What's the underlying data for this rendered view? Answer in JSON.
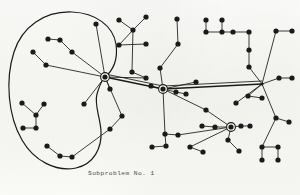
{
  "figure": {
    "caption": "Subproblem No. 1",
    "background_color": "#fbfbf8",
    "ink_color": "#1a1a1a",
    "type": "network-graph-diagram"
  },
  "graph": {
    "node_radius": 2.6,
    "hub_outer_radius": 4.4,
    "edge_width": 0.85,
    "trunk_width": 1.3,
    "boundary_width": 1.2,
    "hubs": [
      {
        "id": "hub-left",
        "label": "left-hub",
        "x": 105,
        "y": 77,
        "ringed": true
      },
      {
        "id": "hub-center",
        "label": "center-hub",
        "x": 163,
        "y": 89,
        "ringed": true
      },
      {
        "id": "hub-right",
        "label": "right-hub",
        "x": 262,
        "y": 84,
        "ringed": false
      },
      {
        "id": "hub-bottom",
        "label": "bottom-hub",
        "x": 231,
        "y": 127,
        "ringed": true
      }
    ],
    "nodes": [
      {
        "id": "n1",
        "x": 96,
        "y": 24
      },
      {
        "id": "n2",
        "x": 48,
        "y": 39
      },
      {
        "id": "n3",
        "x": 60,
        "y": 40
      },
      {
        "id": "n4",
        "x": 72,
        "y": 52
      },
      {
        "id": "n5",
        "x": 33,
        "y": 52
      },
      {
        "id": "n6",
        "x": 46,
        "y": 65
      },
      {
        "id": "n7",
        "x": 110,
        "y": 89
      },
      {
        "id": "n8",
        "x": 22,
        "y": 103
      },
      {
        "id": "n9",
        "x": 36,
        "y": 115
      },
      {
        "id": "n10",
        "x": 23,
        "y": 128
      },
      {
        "id": "n11",
        "x": 36,
        "y": 128
      },
      {
        "id": "n12",
        "x": 44,
        "y": 104
      },
      {
        "id": "n13",
        "x": 84,
        "y": 104
      },
      {
        "id": "n14",
        "x": 47,
        "y": 146
      },
      {
        "id": "n15",
        "x": 60,
        "y": 156
      },
      {
        "id": "n16",
        "x": 72,
        "y": 157
      },
      {
        "id": "n17",
        "x": 119,
        "y": 20
      },
      {
        "id": "n18",
        "x": 146,
        "y": 17
      },
      {
        "id": "n19",
        "x": 133,
        "y": 30
      },
      {
        "id": "n20",
        "x": 146,
        "y": 44
      },
      {
        "id": "n21",
        "x": 119,
        "y": 45
      },
      {
        "id": "n22",
        "x": 132,
        "y": 72
      },
      {
        "id": "n23",
        "x": 146,
        "y": 78
      },
      {
        "id": "n24",
        "x": 177,
        "y": 19
      },
      {
        "id": "n25",
        "x": 178,
        "y": 44
      },
      {
        "id": "n26",
        "x": 160,
        "y": 68
      },
      {
        "id": "n27",
        "x": 151,
        "y": 86
      },
      {
        "id": "n28",
        "x": 176,
        "y": 92
      },
      {
        "id": "n29",
        "x": 186,
        "y": 94
      },
      {
        "id": "n30",
        "x": 196,
        "y": 82
      },
      {
        "id": "n31",
        "x": 206,
        "y": 20
      },
      {
        "id": "n32",
        "x": 222,
        "y": 20
      },
      {
        "id": "n33",
        "x": 206,
        "y": 32
      },
      {
        "id": "n34",
        "x": 222,
        "y": 32
      },
      {
        "id": "n35",
        "x": 233,
        "y": 32
      },
      {
        "id": "n36",
        "x": 249,
        "y": 32
      },
      {
        "id": "n37",
        "x": 249,
        "y": 50
      },
      {
        "id": "n38",
        "x": 249,
        "y": 67
      },
      {
        "id": "n39",
        "x": 276,
        "y": 31
      },
      {
        "id": "n40",
        "x": 292,
        "y": 31
      },
      {
        "id": "n41",
        "x": 279,
        "y": 78
      },
      {
        "id": "n42",
        "x": 292,
        "y": 78
      },
      {
        "id": "n43",
        "x": 248,
        "y": 96
      },
      {
        "id": "n44",
        "x": 262,
        "y": 98
      },
      {
        "id": "n45",
        "x": 236,
        "y": 103
      },
      {
        "id": "n46",
        "x": 215,
        "y": 127
      },
      {
        "id": "n47",
        "x": 202,
        "y": 126
      },
      {
        "id": "n48",
        "x": 241,
        "y": 126
      },
      {
        "id": "n49",
        "x": 250,
        "y": 126
      },
      {
        "id": "n50",
        "x": 228,
        "y": 140
      },
      {
        "id": "n51",
        "x": 239,
        "y": 151
      },
      {
        "id": "n52",
        "x": 190,
        "y": 147
      },
      {
        "id": "n53",
        "x": 203,
        "y": 152
      },
      {
        "id": "n54",
        "x": 178,
        "y": 135
      },
      {
        "id": "n55",
        "x": 166,
        "y": 146
      },
      {
        "id": "n56",
        "x": 165,
        "y": 134
      },
      {
        "id": "n57",
        "x": 152,
        "y": 147
      },
      {
        "id": "n58",
        "x": 262,
        "y": 147
      },
      {
        "id": "n59",
        "x": 278,
        "y": 147
      },
      {
        "id": "n60",
        "x": 262,
        "y": 160
      },
      {
        "id": "n61",
        "x": 278,
        "y": 160
      },
      {
        "id": "n62",
        "x": 276,
        "y": 118
      },
      {
        "id": "n63",
        "x": 289,
        "y": 122
      },
      {
        "id": "n64",
        "x": 206,
        "y": 110
      },
      {
        "id": "n65",
        "x": 122,
        "y": 116
      },
      {
        "id": "n66",
        "x": 110,
        "y": 129
      }
    ],
    "edges": [
      [
        "hub-left",
        "n1"
      ],
      [
        "hub-left",
        "n4"
      ],
      [
        "hub-left",
        "n6"
      ],
      [
        "hub-left",
        "n7"
      ],
      [
        "hub-left",
        "n13"
      ],
      [
        "hub-left",
        "n65"
      ],
      [
        "n4",
        "n3"
      ],
      [
        "n3",
        "n2"
      ],
      [
        "n6",
        "n5"
      ],
      [
        "n12",
        "n9"
      ],
      [
        "n9",
        "n8"
      ],
      [
        "n9",
        "n11"
      ],
      [
        "n11",
        "n10"
      ],
      [
        "n65",
        "n66"
      ],
      [
        "n66",
        "n16"
      ],
      [
        "n16",
        "n15"
      ],
      [
        "n15",
        "n14"
      ],
      [
        "hub-left",
        "hub-center"
      ],
      [
        "hub-center",
        "hub-right"
      ],
      [
        "hub-left",
        "n23"
      ],
      [
        "n23",
        "n22"
      ],
      [
        "n22",
        "n19"
      ],
      [
        "n19",
        "n17"
      ],
      [
        "n19",
        "n21"
      ],
      [
        "n19",
        "n18"
      ],
      [
        "n21",
        "n20"
      ],
      [
        "hub-center",
        "n26"
      ],
      [
        "n26",
        "n25"
      ],
      [
        "n25",
        "n24"
      ],
      [
        "hub-center",
        "n27"
      ],
      [
        "hub-center",
        "n28"
      ],
      [
        "n28",
        "n29"
      ],
      [
        "hub-center",
        "n30"
      ],
      [
        "hub-center",
        "n56"
      ],
      [
        "n56",
        "n55"
      ],
      [
        "n55",
        "n57"
      ],
      [
        "n56",
        "n54"
      ],
      [
        "hub-right",
        "n38"
      ],
      [
        "n38",
        "n37"
      ],
      [
        "n37",
        "n36"
      ],
      [
        "n36",
        "n35"
      ],
      [
        "n35",
        "n34"
      ],
      [
        "n34",
        "n33"
      ],
      [
        "n33",
        "n31"
      ],
      [
        "n34",
        "n32"
      ],
      [
        "hub-right",
        "n39"
      ],
      [
        "n39",
        "n40"
      ],
      [
        "hub-right",
        "n41"
      ],
      [
        "n41",
        "n42"
      ],
      [
        "hub-right",
        "n43"
      ],
      [
        "n43",
        "n44"
      ],
      [
        "hub-right",
        "n45"
      ],
      [
        "hub-right",
        "n62"
      ],
      [
        "n62",
        "n63"
      ],
      [
        "n62",
        "n58"
      ],
      [
        "n58",
        "n59"
      ],
      [
        "n58",
        "n60"
      ],
      [
        "n59",
        "n61"
      ],
      [
        "hub-bottom",
        "n46"
      ],
      [
        "n46",
        "n47"
      ],
      [
        "hub-bottom",
        "n48"
      ],
      [
        "n48",
        "n49"
      ],
      [
        "hub-bottom",
        "n64"
      ],
      [
        "hub-bottom",
        "n50"
      ],
      [
        "n50",
        "n51"
      ],
      [
        "hub-bottom",
        "n52"
      ],
      [
        "n52",
        "n53"
      ],
      [
        "hub-bottom",
        "n54"
      ],
      [
        "hub-center",
        "n64"
      ]
    ],
    "boundary": {
      "id": "subproblem-boundary",
      "shape": "kidney",
      "path": "M 104 78 C 114 70, 118 58, 116 44 C 113 26, 96 13, 72 12 C 44 11, 22 27, 14 52 C 5 80, 8 116, 22 140 C 34 161, 56 172, 76 168 C 94 164, 102 148, 101 131 C 100 116, 94 105, 97 94 C 99 87, 101 82, 104 78 Z"
    }
  }
}
